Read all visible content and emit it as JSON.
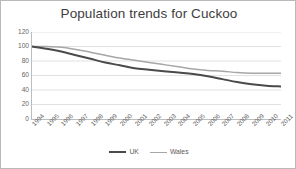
{
  "chart_data": {
    "type": "line",
    "title": "Population trends for Cuckoo",
    "xlabel": "",
    "ylabel": "",
    "ylim": [
      0,
      120
    ],
    "yticks": [
      0,
      20,
      40,
      60,
      80,
      100,
      120
    ],
    "grid": true,
    "legend_position": "bottom",
    "categories": [
      "1994",
      "1995",
      "1996",
      "1997",
      "1998",
      "1999",
      "2000",
      "2001",
      "2002",
      "2003",
      "2004",
      "2005",
      "2006",
      "2007",
      "2008",
      "2009",
      "2010",
      "2011"
    ],
    "series": [
      {
        "name": "UK",
        "color": "#4a4a4a",
        "line_width": 2.0,
        "values": [
          100,
          97,
          93,
          88,
          83,
          78,
          74,
          70,
          68,
          66,
          64,
          62,
          59,
          55,
          51,
          48,
          46,
          45
        ]
      },
      {
        "name": "Wales",
        "color": "#a6a6a6",
        "line_width": 1.5,
        "values": [
          100,
          100,
          99,
          96,
          92,
          88,
          84,
          81,
          78,
          75,
          72,
          69,
          67,
          66,
          64,
          63,
          63,
          63
        ]
      }
    ]
  },
  "legend": {
    "items": [
      {
        "label": "UK"
      },
      {
        "label": "Wales"
      }
    ]
  },
  "colors": {
    "uk_line": "#4a4a4a",
    "wales_line": "#a6a6a6",
    "gridline": "#d9d9d9",
    "axis": "#bdbdbd",
    "tick_text": "#666666",
    "title_text": "#3d3d3d",
    "border": "#b9b9b9",
    "background": "#ffffff"
  }
}
